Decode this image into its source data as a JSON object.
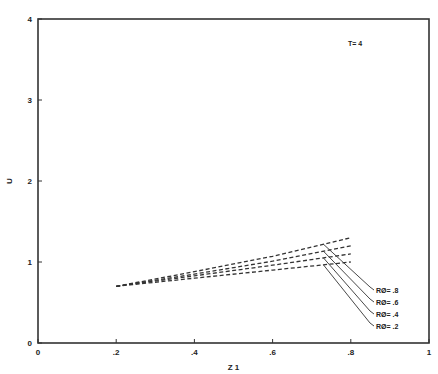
{
  "chart_data": {
    "type": "line",
    "title": "",
    "annotation": "T= 4",
    "xlabel": "Z 1",
    "ylabel": "U",
    "xlim": [
      0,
      1
    ],
    "ylim": [
      0,
      4
    ],
    "x_ticks": [
      "0",
      ".2",
      ".4",
      ".6",
      ".8",
      "1"
    ],
    "x_tick_values": [
      0,
      0.2,
      0.4,
      0.6,
      0.8,
      1.0
    ],
    "y_ticks": [
      "0",
      "1",
      "2",
      "3",
      "4"
    ],
    "y_tick_values": [
      0,
      1,
      2,
      3,
      4
    ],
    "grid": false,
    "line_style": "dashed",
    "x": [
      0.2,
      0.4,
      0.6,
      0.8
    ],
    "series": [
      {
        "name": "RØ = .8",
        "label": "RØ= .8",
        "values": [
          0.7,
          0.88,
          1.07,
          1.3
        ]
      },
      {
        "name": "RØ = .6",
        "label": "RØ= .6",
        "values": [
          0.7,
          0.85,
          1.01,
          1.2
        ]
      },
      {
        "name": "RØ = .4",
        "label": "RØ= .4",
        "values": [
          0.7,
          0.83,
          0.96,
          1.1
        ]
      },
      {
        "name": "RØ = .2",
        "label": "RØ= .2",
        "values": [
          0.7,
          0.8,
          0.9,
          1.0
        ]
      }
    ]
  }
}
